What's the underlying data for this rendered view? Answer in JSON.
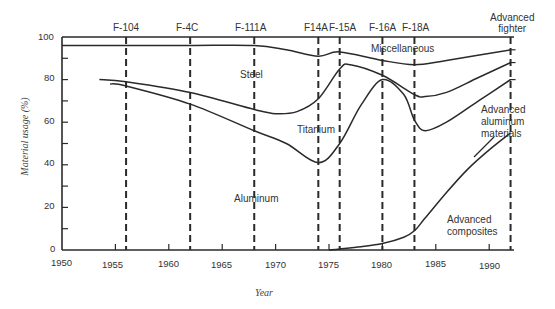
{
  "chart_data": {
    "type": "line",
    "title": "",
    "xlabel": "Year",
    "ylabel": "Material usage (%)",
    "xlim": [
      1950,
      1992
    ],
    "ylim": [
      0,
      100
    ],
    "x_ticks": [
      1950,
      1955,
      1960,
      1965,
      1970,
      1975,
      1980,
      1985,
      1990
    ],
    "y_ticks": [
      0,
      20,
      40,
      60,
      80,
      100
    ],
    "y_minor_ticks": [
      10,
      30,
      50,
      70,
      90
    ],
    "grid": false,
    "legend": "none (regions labeled inline)",
    "aircraft_markers": [
      {
        "label": "F-104",
        "year": 1956
      },
      {
        "label": "F-4C",
        "year": 1962
      },
      {
        "label": "F-111A",
        "year": 1968
      },
      {
        "label": "F14A",
        "year": 1974
      },
      {
        "label": "F-15A",
        "year": 1976
      },
      {
        "label": "F-16A",
        "year": 1980
      },
      {
        "label": "F-18A",
        "year": 1983
      },
      {
        "label": "Advanced fighter",
        "year": 1992
      }
    ],
    "region_labels": [
      "Miscellaneous",
      "Steel",
      "Titanium",
      "Aluminum",
      "Advanced aluminum materials",
      "Advanced composites"
    ],
    "series": [
      {
        "name": "Miscellaneous boundary (top of steel)",
        "x": [
          1950,
          1956,
          1962,
          1968,
          1971,
          1974,
          1976,
          1980,
          1983,
          1986,
          1992
        ],
        "values": [
          96,
          96,
          96,
          96,
          94,
          91,
          93,
          89,
          87,
          89,
          94
        ]
      },
      {
        "name": "Steel boundary (top of titanium)",
        "x": [
          1953.5,
          1956,
          1962,
          1968,
          1970,
          1972,
          1974,
          1976,
          1977,
          1980,
          1983,
          1984,
          1986,
          1989,
          1992
        ],
        "values": [
          80,
          79,
          74,
          66,
          64,
          65,
          71,
          85,
          87,
          82,
          73,
          72,
          74,
          81,
          88
        ]
      },
      {
        "name": "Titanium boundary (top of aluminum)",
        "x": [
          1954.5,
          1956,
          1962,
          1968,
          1971,
          1974,
          1976,
          1978,
          1980,
          1982,
          1983,
          1984,
          1986,
          1989,
          1992
        ],
        "values": [
          78,
          77,
          68.5,
          56,
          50,
          41,
          50,
          68,
          80,
          73,
          61,
          56,
          60,
          70,
          80
        ]
      },
      {
        "name": "Advanced composites",
        "x": [
          1975,
          1976,
          1978,
          1980,
          1982,
          1983,
          1984,
          1986,
          1988,
          1990,
          1992
        ],
        "values": [
          0,
          0.5,
          1.5,
          3,
          6,
          9,
          15,
          27,
          38,
          47,
          55
        ]
      }
    ]
  },
  "axis": {
    "x_title": "Year",
    "y_title": "Material usage (%)",
    "x_ticks": [
      "1950",
      "1955",
      "1960",
      "1965",
      "1970",
      "1975",
      "1980",
      "1985",
      "1990"
    ],
    "y_ticks": [
      "0",
      "20",
      "40",
      "60",
      "80",
      "100"
    ]
  },
  "aircraft": [
    "F-104",
    "F-4C",
    "F-111A",
    "F14A",
    "F-15A",
    "F-16A",
    "F-18A",
    "Advanced fighter"
  ],
  "aircraft_lines": [
    "Advanced",
    "fighter"
  ],
  "regions": {
    "misc": "Miscellaneous",
    "steel": "Steel",
    "titanium": "Titanium",
    "aluminum": "Aluminum",
    "adv_al": [
      "Advanced",
      "aluminum",
      "materials"
    ],
    "composites": [
      "Advanced",
      "composites"
    ]
  },
  "colors": {
    "line": "#2a2a2a",
    "text": "#333333",
    "background": "#ffffff"
  }
}
